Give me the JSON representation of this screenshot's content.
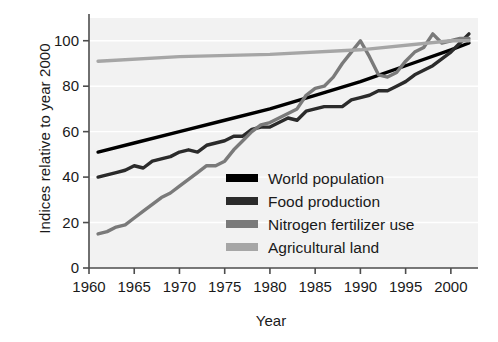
{
  "chart_data": {
    "type": "line",
    "title": "",
    "xlabel": "Year",
    "ylabel": "Indices relative to year 2000",
    "xlim": [
      1960,
      2003
    ],
    "ylim": [
      0,
      110
    ],
    "xticks": [
      1960,
      1965,
      1970,
      1975,
      1980,
      1985,
      1990,
      1995,
      2000
    ],
    "yticks": [
      0,
      20,
      40,
      60,
      80,
      100
    ],
    "grid": false,
    "legend_position": "inside-bottom-right",
    "series": [
      {
        "name": "World population",
        "color": "#000000",
        "x": [
          1961,
          1965,
          1970,
          1975,
          1980,
          1985,
          1990,
          1995,
          2000,
          2002
        ],
        "values": [
          51,
          55,
          60,
          65,
          70,
          76,
          82,
          89,
          96,
          99
        ]
      },
      {
        "name": "Food production",
        "color": "#2b2b2b",
        "x": [
          1961,
          1962,
          1963,
          1964,
          1965,
          1966,
          1967,
          1968,
          1969,
          1970,
          1971,
          1972,
          1973,
          1974,
          1975,
          1976,
          1977,
          1978,
          1979,
          1980,
          1981,
          1982,
          1983,
          1984,
          1985,
          1986,
          1987,
          1988,
          1989,
          1990,
          1991,
          1992,
          1993,
          1994,
          1995,
          1996,
          1997,
          1998,
          1999,
          2000,
          2001,
          2002
        ],
        "values": [
          40,
          41,
          42,
          43,
          45,
          44,
          47,
          48,
          49,
          51,
          52,
          51,
          54,
          55,
          56,
          58,
          58,
          61,
          62,
          62,
          64,
          66,
          65,
          69,
          70,
          71,
          71,
          71,
          74,
          75,
          76,
          78,
          78,
          80,
          82,
          85,
          87,
          89,
          92,
          95,
          99,
          103
        ]
      },
      {
        "name": "Nitrogen fertilizer use",
        "color": "#7a7a7a",
        "x": [
          1961,
          1962,
          1963,
          1964,
          1965,
          1966,
          1967,
          1968,
          1969,
          1970,
          1971,
          1972,
          1973,
          1974,
          1975,
          1976,
          1977,
          1978,
          1979,
          1980,
          1981,
          1982,
          1983,
          1984,
          1985,
          1986,
          1987,
          1988,
          1989,
          1990,
          1991,
          1992,
          1993,
          1994,
          1995,
          1996,
          1997,
          1998,
          1999,
          2000,
          2001,
          2002
        ],
        "values": [
          15,
          16,
          18,
          19,
          22,
          25,
          28,
          31,
          33,
          36,
          39,
          42,
          45,
          45,
          47,
          52,
          56,
          60,
          63,
          64,
          66,
          68,
          70,
          76,
          79,
          80,
          84,
          90,
          95,
          100,
          93,
          85,
          84,
          86,
          91,
          95,
          97,
          103,
          99,
          100,
          101,
          101
        ]
      },
      {
        "name": "Agricultural land",
        "color": "#a6a6a6",
        "x": [
          1961,
          1970,
          1980,
          1990,
          2000,
          2002
        ],
        "values": [
          91,
          93,
          94,
          96,
          100,
          100
        ]
      }
    ]
  },
  "legend": {
    "items": [
      {
        "label": "World population",
        "color": "#000000"
      },
      {
        "label": "Food production",
        "color": "#2b2b2b"
      },
      {
        "label": "Nitrogen fertilizer use",
        "color": "#7a7a7a"
      },
      {
        "label": "Agricultural land",
        "color": "#a6a6a6"
      }
    ]
  }
}
